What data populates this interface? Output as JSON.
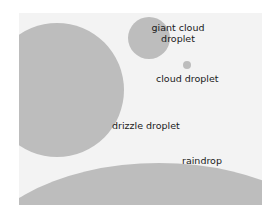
{
  "diagram": {
    "title": "",
    "fill_color": "#bdbdbd",
    "background_color": "#f3f3f3",
    "items": [
      {
        "id": "giant-cloud",
        "label_line1": "giant cloud",
        "label_line2": "droplet"
      },
      {
        "id": "cloud",
        "label": "cloud droplet"
      },
      {
        "id": "drizzle",
        "label": "drizzle droplet"
      },
      {
        "id": "raindrop",
        "label": "raindrop"
      }
    ]
  }
}
